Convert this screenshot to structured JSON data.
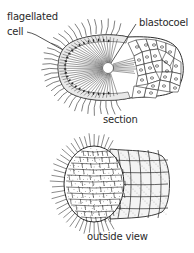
{
  "figure": {
    "labels": {
      "flagellated_line1": "flagellated",
      "flagellated_line2": "cell",
      "blastocoel": "blastocoel",
      "section_caption": "section",
      "outside_caption": "outside view"
    },
    "colors": {
      "ink": "#2a2a2a",
      "background": "#ffffff"
    }
  }
}
